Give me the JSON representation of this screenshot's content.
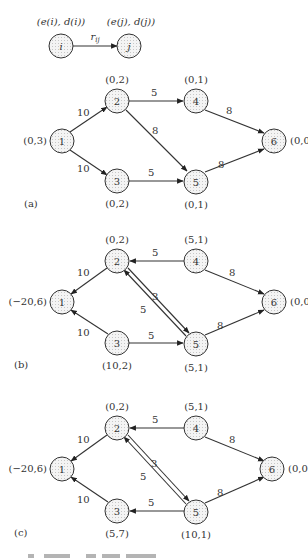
{
  "legend": {
    "node_i": "i",
    "node_j": "j",
    "label_i": "(e(i), d(i))",
    "label_j": "(e(j), d(j))",
    "edge_label": "r",
    "edge_sub": "ij"
  },
  "panels": [
    {
      "id": "a",
      "tag": "(a)",
      "nodes": [
        {
          "id": "1",
          "label": "(0,3)"
        },
        {
          "id": "2",
          "label": "(0,2)"
        },
        {
          "id": "3",
          "label": "(0,2)"
        },
        {
          "id": "4",
          "label": "(0,1)"
        },
        {
          "id": "5",
          "label": "(0,1)"
        },
        {
          "id": "6",
          "label": "(0,0)"
        }
      ],
      "edges": [
        {
          "from": "1",
          "to": "2",
          "weight": "10"
        },
        {
          "from": "1",
          "to": "3",
          "weight": "10"
        },
        {
          "from": "2",
          "to": "4",
          "weight": "5"
        },
        {
          "from": "2",
          "to": "5",
          "weight": "8"
        },
        {
          "from": "3",
          "to": "5",
          "weight": "5"
        },
        {
          "from": "4",
          "to": "6",
          "weight": "8"
        },
        {
          "from": "5",
          "to": "6",
          "weight": "8"
        }
      ]
    },
    {
      "id": "b",
      "tag": "(b)",
      "nodes": [
        {
          "id": "1",
          "label": "(−20,6)"
        },
        {
          "id": "2",
          "label": "(0,2)"
        },
        {
          "id": "3",
          "label": "(10,2)"
        },
        {
          "id": "4",
          "label": "(5,1)"
        },
        {
          "id": "5",
          "label": "(5,1)"
        },
        {
          "id": "6",
          "label": "(0,0)"
        }
      ],
      "edges": [
        {
          "from": "2",
          "to": "1",
          "weight": "10"
        },
        {
          "from": "3",
          "to": "1",
          "weight": "10"
        },
        {
          "from": "4",
          "to": "2",
          "weight": "5"
        },
        {
          "from": "2",
          "to": "5",
          "weight": "3"
        },
        {
          "from": "5",
          "to": "2",
          "weight": "5"
        },
        {
          "from": "3",
          "to": "5",
          "weight": "5"
        },
        {
          "from": "4",
          "to": "6",
          "weight": "8"
        },
        {
          "from": "5",
          "to": "6",
          "weight": "8"
        }
      ]
    },
    {
      "id": "c",
      "tag": "(c)",
      "nodes": [
        {
          "id": "1",
          "label": "(−20,6)"
        },
        {
          "id": "2",
          "label": "(0,2)"
        },
        {
          "id": "3",
          "label": "(5,7)"
        },
        {
          "id": "4",
          "label": "(5,1)"
        },
        {
          "id": "5",
          "label": "(10,1)"
        },
        {
          "id": "6",
          "label": "(0,0)"
        }
      ],
      "edges": [
        {
          "from": "2",
          "to": "1",
          "weight": "10"
        },
        {
          "from": "3",
          "to": "1",
          "weight": "10"
        },
        {
          "from": "4",
          "to": "2",
          "weight": "5"
        },
        {
          "from": "2",
          "to": "5",
          "weight": "3"
        },
        {
          "from": "5",
          "to": "2",
          "weight": "5"
        },
        {
          "from": "5",
          "to": "3",
          "weight": "5"
        },
        {
          "from": "4",
          "to": "6",
          "weight": "8"
        },
        {
          "from": "5",
          "to": "6",
          "weight": "8"
        }
      ]
    }
  ]
}
